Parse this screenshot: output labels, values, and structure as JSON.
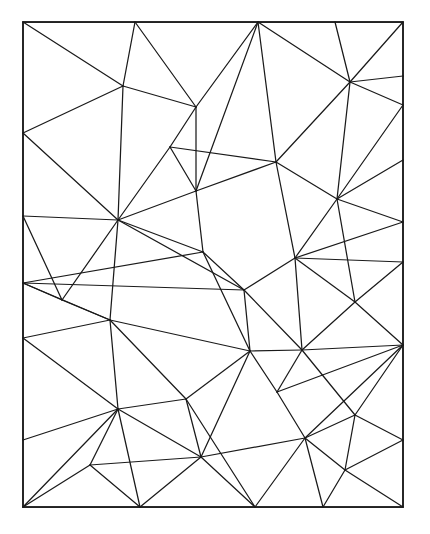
{
  "figure": {
    "type": "triangulation-diagram",
    "canvas": {
      "width": 430,
      "height": 534
    },
    "background_color": "#ffffff",
    "line_color": "#1a1a1a",
    "edge_stroke_width": 1.25,
    "border_stroke_width": 1.7
  },
  "domain_boundary": {
    "name": "rectangular-frame",
    "x_min": 23,
    "y_min": 22,
    "x_max": 403,
    "y_max": 507,
    "width": 380,
    "height": 485
  },
  "counts": {
    "vertices": 46,
    "edges": 118,
    "boundary_vertices": 22
  },
  "mesh": {
    "vertices": [
      {
        "id": 0,
        "x": 23,
        "y": 22,
        "boundary": true
      },
      {
        "id": 1,
        "x": 135,
        "y": 22,
        "boundary": true
      },
      {
        "id": 2,
        "x": 258,
        "y": 22,
        "boundary": true
      },
      {
        "id": 3,
        "x": 335,
        "y": 22,
        "boundary": true
      },
      {
        "id": 4,
        "x": 403,
        "y": 22,
        "boundary": true
      },
      {
        "id": 5,
        "x": 403,
        "y": 76,
        "boundary": true
      },
      {
        "id": 6,
        "x": 403,
        "y": 105,
        "boundary": true
      },
      {
        "id": 7,
        "x": 403,
        "y": 160,
        "boundary": true
      },
      {
        "id": 8,
        "x": 403,
        "y": 222,
        "boundary": true
      },
      {
        "id": 9,
        "x": 403,
        "y": 262,
        "boundary": true
      },
      {
        "id": 10,
        "x": 403,
        "y": 345,
        "boundary": true
      },
      {
        "id": 11,
        "x": 403,
        "y": 440,
        "boundary": true
      },
      {
        "id": 12,
        "x": 403,
        "y": 507,
        "boundary": true
      },
      {
        "id": 13,
        "x": 323,
        "y": 507,
        "boundary": true
      },
      {
        "id": 14,
        "x": 255,
        "y": 507,
        "boundary": true
      },
      {
        "id": 15,
        "x": 140,
        "y": 507,
        "boundary": true
      },
      {
        "id": 16,
        "x": 23,
        "y": 507,
        "boundary": true
      },
      {
        "id": 17,
        "x": 23,
        "y": 440,
        "boundary": true
      },
      {
        "id": 18,
        "x": 23,
        "y": 338,
        "boundary": true
      },
      {
        "id": 19,
        "x": 23,
        "y": 283,
        "boundary": true
      },
      {
        "id": 20,
        "x": 23,
        "y": 216,
        "boundary": true
      },
      {
        "id": 21,
        "x": 23,
        "y": 133,
        "boundary": true
      },
      {
        "id": 22,
        "x": 123,
        "y": 86,
        "boundary": false
      },
      {
        "id": 23,
        "x": 196,
        "y": 107,
        "boundary": false
      },
      {
        "id": 24,
        "x": 350,
        "y": 82,
        "boundary": false
      },
      {
        "id": 25,
        "x": 276,
        "y": 162,
        "boundary": false
      },
      {
        "id": 26,
        "x": 337,
        "y": 199,
        "boundary": false
      },
      {
        "id": 27,
        "x": 118,
        "y": 220,
        "boundary": false
      },
      {
        "id": 28,
        "x": 196,
        "y": 191,
        "boundary": false
      },
      {
        "id": 29,
        "x": 203,
        "y": 252,
        "boundary": false
      },
      {
        "id": 30,
        "x": 295,
        "y": 258,
        "boundary": false
      },
      {
        "id": 31,
        "x": 244,
        "y": 290,
        "boundary": false
      },
      {
        "id": 32,
        "x": 110,
        "y": 320,
        "boundary": false
      },
      {
        "id": 33,
        "x": 250,
        "y": 351,
        "boundary": false
      },
      {
        "id": 34,
        "x": 302,
        "y": 350,
        "boundary": false
      },
      {
        "id": 35,
        "x": 355,
        "y": 302,
        "boundary": false
      },
      {
        "id": 36,
        "x": 118,
        "y": 409,
        "boundary": false
      },
      {
        "id": 37,
        "x": 186,
        "y": 399,
        "boundary": false
      },
      {
        "id": 38,
        "x": 305,
        "y": 438,
        "boundary": false
      },
      {
        "id": 39,
        "x": 355,
        "y": 415,
        "boundary": false
      },
      {
        "id": 40,
        "x": 201,
        "y": 457,
        "boundary": false
      },
      {
        "id": 41,
        "x": 90,
        "y": 465,
        "boundary": false
      },
      {
        "id": 42,
        "x": 277,
        "y": 392,
        "boundary": false
      },
      {
        "id": 43,
        "x": 62,
        "y": 300,
        "boundary": false
      },
      {
        "id": 44,
        "x": 170,
        "y": 147,
        "boundary": false
      },
      {
        "id": 45,
        "x": 345,
        "y": 470,
        "boundary": false
      }
    ],
    "edges": [
      [
        0,
        22
      ],
      [
        0,
        21
      ],
      [
        0,
        1
      ],
      [
        1,
        22
      ],
      [
        1,
        23
      ],
      [
        1,
        2
      ],
      [
        2,
        3
      ],
      [
        2,
        25
      ],
      [
        2,
        24
      ],
      [
        2,
        23
      ],
      [
        2,
        28
      ],
      [
        3,
        4
      ],
      [
        3,
        24
      ],
      [
        4,
        5
      ],
      [
        4,
        24
      ],
      [
        5,
        6
      ],
      [
        5,
        24
      ],
      [
        6,
        7
      ],
      [
        6,
        26
      ],
      [
        6,
        24
      ],
      [
        7,
        8
      ],
      [
        7,
        26
      ],
      [
        8,
        9
      ],
      [
        8,
        26
      ],
      [
        8,
        30
      ],
      [
        9,
        10
      ],
      [
        9,
        30
      ],
      [
        9,
        35
      ],
      [
        10,
        11
      ],
      [
        10,
        34
      ],
      [
        10,
        35
      ],
      [
        10,
        42
      ],
      [
        10,
        38
      ],
      [
        10,
        39
      ],
      [
        11,
        12
      ],
      [
        11,
        39
      ],
      [
        11,
        45
      ],
      [
        12,
        13
      ],
      [
        12,
        45
      ],
      [
        13,
        14
      ],
      [
        13,
        45
      ],
      [
        13,
        38
      ],
      [
        14,
        15
      ],
      [
        14,
        38
      ],
      [
        14,
        40
      ],
      [
        14,
        37
      ],
      [
        15,
        16
      ],
      [
        15,
        40
      ],
      [
        15,
        41
      ],
      [
        15,
        36
      ],
      [
        16,
        17
      ],
      [
        16,
        41
      ],
      [
        16,
        36
      ],
      [
        17,
        18
      ],
      [
        17,
        36
      ],
      [
        18,
        19
      ],
      [
        18,
        36
      ],
      [
        18,
        32
      ],
      [
        19,
        20
      ],
      [
        19,
        32
      ],
      [
        19,
        43
      ],
      [
        19,
        29
      ],
      [
        19,
        31
      ],
      [
        20,
        21
      ],
      [
        20,
        27
      ],
      [
        20,
        43
      ],
      [
        21,
        22
      ],
      [
        21,
        27
      ],
      [
        22,
        23
      ],
      [
        22,
        27
      ],
      [
        23,
        44
      ],
      [
        23,
        28
      ],
      [
        24,
        25
      ],
      [
        24,
        26
      ],
      [
        25,
        26
      ],
      [
        25,
        28
      ],
      [
        25,
        30
      ],
      [
        25,
        44
      ],
      [
        26,
        30
      ],
      [
        26,
        35
      ],
      [
        27,
        28
      ],
      [
        27,
        29
      ],
      [
        27,
        32
      ],
      [
        27,
        43
      ],
      [
        27,
        44
      ],
      [
        27,
        31
      ],
      [
        28,
        29
      ],
      [
        28,
        44
      ],
      [
        29,
        31
      ],
      [
        29,
        33
      ],
      [
        30,
        31
      ],
      [
        30,
        34
      ],
      [
        30,
        35
      ],
      [
        31,
        33
      ],
      [
        31,
        34
      ],
      [
        32,
        33
      ],
      [
        32,
        36
      ],
      [
        32,
        37
      ],
      [
        32,
        43
      ],
      [
        33,
        34
      ],
      [
        33,
        37
      ],
      [
        33,
        42
      ],
      [
        33,
        40
      ],
      [
        34,
        35
      ],
      [
        34,
        42
      ],
      [
        34,
        39
      ],
      [
        36,
        37
      ],
      [
        36,
        41
      ],
      [
        36,
        40
      ],
      [
        37,
        40
      ],
      [
        38,
        39
      ],
      [
        38,
        42
      ],
      [
        38,
        45
      ],
      [
        38,
        40
      ],
      [
        39,
        45
      ],
      [
        41,
        40
      ]
    ]
  }
}
